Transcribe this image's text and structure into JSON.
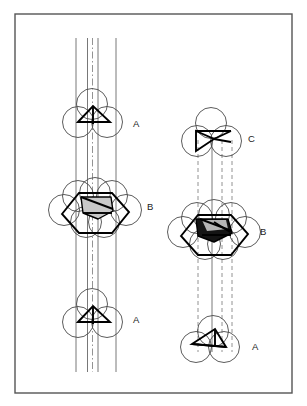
{
  "figure": {
    "title": "",
    "caption": "",
    "background_color": "#ffffff",
    "frame": {
      "name": "figure-border",
      "x": 15,
      "y": 14,
      "width": 277,
      "height": 379,
      "stroke": "#555555",
      "stroke_width": 1.4,
      "fill": "#ffffff"
    }
  },
  "style": {
    "circle_stroke": "#4a4a4a",
    "circle_stroke_width": 0.9,
    "circle_fill": "none",
    "polygon_stroke": "#000000",
    "polygon_stroke_width": 1.9,
    "axis_solid_stroke": "#555555",
    "axis_dashed_stroke": "#777777",
    "axis_stroke_width": 0.8,
    "shade_light": "#c9c9c9",
    "shade_dark": "#141414",
    "label_color": "#1a1a1a",
    "label_font_size": "9.5px"
  },
  "panels": [
    {
      "id": "left-panel",
      "name": "left-stacking-column",
      "axis_type": "solid",
      "axis_lines": [
        {
          "name": "axis-line-1",
          "x": 76,
          "y1": 38,
          "y2": 372,
          "style": "solid"
        },
        {
          "name": "axis-line-2",
          "x": 87.5,
          "y1": 38,
          "y2": 372,
          "style": "solid"
        },
        {
          "name": "axis-line-3",
          "x": 92.5,
          "y1": 38,
          "y2": 372,
          "style": "dashdot"
        },
        {
          "name": "axis-line-4",
          "x": 98,
          "y1": 38,
          "y2": 372,
          "style": "solid"
        },
        {
          "name": "axis-line-5",
          "x": 116,
          "y1": 38,
          "y2": 372,
          "style": "solid"
        }
      ],
      "clusters": [
        {
          "id": "left-A-top",
          "name": "cluster-A-top-left",
          "label": "A",
          "label_x": 133,
          "label_y": 124,
          "type": "A",
          "center": {
            "x": 93,
            "y": 116
          },
          "circle_radius": 15.5,
          "circles": [
            {
              "cx": 92,
              "cy": 104
            },
            {
              "cx": 78,
              "cy": 122
            },
            {
              "cx": 107,
              "cy": 122
            }
          ],
          "polygon": [
            [
              78,
              122
            ],
            [
              93,
              106
            ],
            [
              110,
              122
            ]
          ],
          "polygon_fill": "none",
          "inner_lines": [
            [
              [
                93,
                106
              ],
              [
                93,
                124
              ]
            ]
          ]
        },
        {
          "id": "left-B-middle",
          "name": "cluster-B-middle-left",
          "label": "B",
          "label_x": 147,
          "label_y": 207,
          "type": "B",
          "center": {
            "x": 95,
            "y": 210
          },
          "circle_radius": 15.5,
          "circles": [
            {
              "cx": 78,
              "cy": 196
            },
            {
              "cx": 95,
              "cy": 193
            },
            {
              "cx": 112,
              "cy": 196
            },
            {
              "cx": 64,
              "cy": 210
            },
            {
              "cx": 126,
              "cy": 210
            },
            {
              "cx": 86,
              "cy": 222
            },
            {
              "cx": 104,
              "cy": 222
            }
          ],
          "polygon": [
            [
              62,
              214
            ],
            [
              79,
              193
            ],
            [
              112,
              193
            ],
            [
              129,
              212
            ],
            [
              112,
              233
            ],
            [
              79,
              233
            ]
          ],
          "polygon_fill": "none",
          "shaded_core": {
            "name": "shaded-core-light",
            "points": [
              [
                81,
                197
              ],
              [
                111,
                197
              ],
              [
                113,
                211
              ],
              [
                98,
                219
              ],
              [
                83,
                213
              ]
            ],
            "fill": "#c9c9c9"
          },
          "inner_lines": [
            [
              [
                79,
                193
              ],
              [
                112,
                193
              ]
            ],
            [
              [
                81,
                197
              ],
              [
                113,
                209
              ]
            ],
            [
              [
                83,
                213
              ],
              [
                112,
                213
              ]
            ]
          ]
        },
        {
          "id": "left-A-bottom",
          "name": "cluster-A-bottom-left",
          "label": "A",
          "label_x": 133,
          "label_y": 320,
          "type": "A",
          "center": {
            "x": 93,
            "y": 316
          },
          "circle_radius": 15.5,
          "circles": [
            {
              "cx": 92,
              "cy": 304
            },
            {
              "cx": 78,
              "cy": 322
            },
            {
              "cx": 107,
              "cy": 322
            }
          ],
          "polygon": [
            [
              78,
              322
            ],
            [
              93,
              306
            ],
            [
              110,
              322
            ]
          ],
          "polygon_fill": "none",
          "inner_lines": [
            [
              [
                93,
                306
              ],
              [
                93,
                324
              ]
            ]
          ]
        }
      ]
    },
    {
      "id": "right-panel",
      "name": "right-stacking-column",
      "axis_type": "dashed",
      "axis_lines": [
        {
          "name": "axis-line-1",
          "x": 198,
          "y1": 140,
          "y2": 352,
          "style": "dashed"
        },
        {
          "name": "axis-line-2",
          "x": 212,
          "y1": 140,
          "y2": 352,
          "style": "solid-short"
        },
        {
          "name": "axis-line-3",
          "x": 222,
          "y1": 140,
          "y2": 352,
          "style": "dashed"
        },
        {
          "name": "axis-line-4",
          "x": 232,
          "y1": 140,
          "y2": 352,
          "style": "dashed"
        }
      ],
      "clusters": [
        {
          "id": "right-C-top",
          "name": "cluster-C-top-right",
          "label": "C",
          "label_x": 248,
          "label_y": 139,
          "type": "C",
          "center": {
            "x": 212,
            "y": 135
          },
          "circle_radius": 15.5,
          "circles": [
            {
              "cx": 211,
              "cy": 123
            },
            {
              "cx": 197,
              "cy": 141
            },
            {
              "cx": 226,
              "cy": 141
            }
          ],
          "polygon": [
            [
              196,
              131
            ],
            [
              214,
              139
            ],
            [
              196,
              151
            ]
          ],
          "polygon_fill": "none",
          "inner_lines": [
            [
              [
                196,
                131
              ],
              [
                231,
                131
              ]
            ],
            [
              [
                214,
                139
              ],
              [
                231,
                131
              ]
            ],
            [
              [
                214,
                139
              ],
              [
                231,
                142
              ]
            ]
          ]
        },
        {
          "id": "right-B-middle",
          "name": "cluster-B-middle-right",
          "label": "B",
          "label_x": 260,
          "label_y": 232,
          "type": "B",
          "center": {
            "x": 214,
            "y": 232
          },
          "circle_radius": 15.5,
          "circles": [
            {
              "cx": 197,
              "cy": 218
            },
            {
              "cx": 214,
              "cy": 215
            },
            {
              "cx": 231,
              "cy": 218
            },
            {
              "cx": 183,
              "cy": 232
            },
            {
              "cx": 245,
              "cy": 232
            },
            {
              "cx": 205,
              "cy": 244
            },
            {
              "cx": 223,
              "cy": 244
            }
          ],
          "polygon": [
            [
              181,
              236
            ],
            [
              198,
              215
            ],
            [
              231,
              215
            ],
            [
              248,
              234
            ],
            [
              231,
              255
            ],
            [
              198,
              255
            ]
          ],
          "polygon_fill": "none",
          "shaded_core": {
            "name": "shaded-core-dark",
            "points": [
              [
                196,
                219
              ],
              [
                228,
                219
              ],
              [
                232,
                233
              ],
              [
                214,
                242
              ],
              [
                198,
                236
              ]
            ],
            "fill": "#141414"
          },
          "shaded_highlight": {
            "name": "shaded-core-light",
            "points": [
              [
                202,
                220
              ],
              [
                226,
                220
              ],
              [
                228,
                229
              ],
              [
                207,
                231
              ]
            ],
            "fill": "#b5b5b5"
          },
          "inner_lines": [
            [
              [
                198,
                215
              ],
              [
                231,
                215
              ]
            ],
            [
              [
                200,
                219
              ],
              [
                232,
                231
              ]
            ],
            [
              [
                202,
                235
              ],
              [
                231,
                235
              ]
            ],
            [
              [
                214,
                222
              ],
              [
                230,
                232
              ]
            ]
          ]
        },
        {
          "id": "right-A-bottom",
          "name": "cluster-A-bottom-right",
          "label": "A",
          "label_x": 252,
          "label_y": 347,
          "type": "A",
          "center": {
            "x": 208,
            "y": 343
          },
          "circle_radius": 15.5,
          "circles": [
            {
              "cx": 213,
              "cy": 331
            },
            {
              "cx": 196,
              "cy": 347
            },
            {
              "cx": 224,
              "cy": 347
            }
          ],
          "polygon": [
            [
              192,
              344
            ],
            [
              215,
              329
            ],
            [
              226,
              347
            ]
          ],
          "polygon_fill": "none",
          "inner_lines": [
            [
              [
                215,
                329
              ],
              [
                215,
                347
              ]
            ],
            [
              [
                192,
                344
              ],
              [
                226,
                347
              ]
            ]
          ]
        }
      ]
    }
  ],
  "labels": [
    {
      "name": "label-A-top-left",
      "text": "A",
      "x": 133,
      "y": 124
    },
    {
      "name": "label-B-middle-left",
      "text": "B",
      "x": 147,
      "y": 207
    },
    {
      "name": "label-A-bottom-left",
      "text": "A",
      "x": 133,
      "y": 320
    },
    {
      "name": "label-C-top-right",
      "text": "C",
      "x": 248,
      "y": 139
    },
    {
      "name": "label-B-middle-right",
      "text": "B",
      "x": 260,
      "y": 232
    },
    {
      "name": "label-A-bottom-right",
      "text": "A",
      "x": 252,
      "y": 347
    }
  ]
}
